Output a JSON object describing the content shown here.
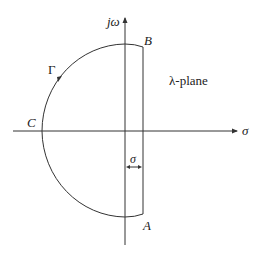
{
  "diagram": {
    "plane_label": "λ-plane",
    "axis_vertical_label": "jω",
    "axis_horizontal_label": "σ",
    "contour_label": "Γ",
    "point_a": "A",
    "point_b": "B",
    "point_c": "C",
    "offset_label": "σ",
    "colors": {
      "stroke": "#333333",
      "background": "#ffffff"
    }
  }
}
